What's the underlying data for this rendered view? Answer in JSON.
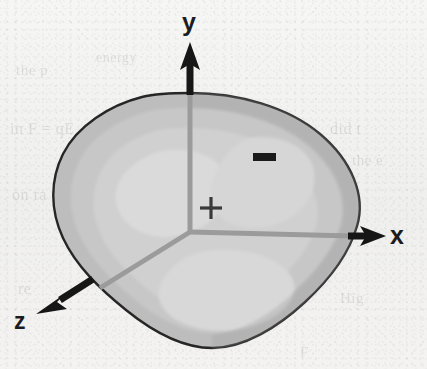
{
  "figure": {
    "kind": "3d-coordinate-axes-with-deformed-body",
    "background_color": "#f2f2f0",
    "outline_color": "#262626",
    "body_fill_outer": "#bdbdbd",
    "body_fill_mid": "#c9c9c9",
    "body_fill_inner": "#d4d4d4",
    "body_fill_core": "#dcdcdc",
    "axis_line_color": "#9a9a9a",
    "arrow_color": "#161616"
  },
  "axes": [
    {
      "name": "y-axis",
      "label": "y",
      "direction": "up",
      "label_x": 182,
      "label_y": 8,
      "tip_x": 190,
      "tip_y": 46,
      "origin_x": 190,
      "origin_y": 232
    },
    {
      "name": "x-axis",
      "label": "x",
      "direction": "right",
      "label_x": 390,
      "label_y": 221,
      "tip_x": 381,
      "tip_y": 236,
      "origin_x": 190,
      "origin_y": 232
    },
    {
      "name": "z-axis",
      "label": "z",
      "direction": "lower-left",
      "label_x": 14,
      "label_y": 308,
      "tip_x": 38,
      "tip_y": 312,
      "origin_x": 190,
      "origin_y": 232
    }
  ],
  "markers": [
    {
      "name": "plus-sign",
      "symbol": "+",
      "x": 211,
      "y": 208,
      "width": 22,
      "height": 22,
      "stroke": 3,
      "color": "#3a3a3a"
    },
    {
      "name": "minus-sign",
      "symbol": "−",
      "x": 253,
      "y": 153,
      "width": 23,
      "height": 8,
      "color": "#1a1a1a"
    }
  ],
  "ghost_text": [
    {
      "text": "the p",
      "x": 16,
      "y": 62,
      "size": 15,
      "rotate": 0
    },
    {
      "text": "energy",
      "x": 96,
      "y": 50,
      "size": 14,
      "rotate": 0
    },
    {
      "text": "in F = qE",
      "x": 10,
      "y": 120,
      "size": 16,
      "rotate": 0
    },
    {
      "text": "the f",
      "x": 128,
      "y": 118,
      "size": 15,
      "rotate": 0
    },
    {
      "text": "did t",
      "x": 330,
      "y": 120,
      "size": 16,
      "rotate": 0
    },
    {
      "text": "an th",
      "x": 270,
      "y": 150,
      "size": 15,
      "rotate": 0
    },
    {
      "text": "the e",
      "x": 352,
      "y": 152,
      "size": 15,
      "rotate": 0
    },
    {
      "text": "on ra",
      "x": 12,
      "y": 186,
      "size": 16,
      "rotate": 0
    },
    {
      "text": "pro",
      "x": 330,
      "y": 188,
      "size": 15,
      "rotate": 0
    },
    {
      "text": "re",
      "x": 18,
      "y": 280,
      "size": 16,
      "rotate": 0
    },
    {
      "text": "Hig",
      "x": 340,
      "y": 290,
      "size": 15,
      "rotate": 0
    },
    {
      "text": "F",
      "x": 300,
      "y": 344,
      "size": 15,
      "rotate": 0
    }
  ]
}
